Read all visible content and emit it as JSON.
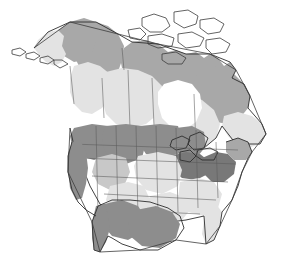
{
  "figure": {
    "kind": "map",
    "region": "North America",
    "projection_look": "conic",
    "background_color": "#ffffff",
    "width": 288,
    "height": 265,
    "has_labels": false,
    "has_legend": false,
    "has_title": false,
    "has_border": false
  },
  "palette": {
    "outline_stroke": "#3c3c3c",
    "subdivision_stroke": "#5a5a5a",
    "coast_stroke": "#2e2e2e",
    "shade_none": "#ffffff",
    "shade_light": "#e3e3e3",
    "shade_med": "#c8c8c8",
    "shade_medium": "#a8a8a8",
    "shade_dark": "#8d8d8d",
    "shade_darkest": "#787878",
    "water": "#ffffff"
  },
  "shading_levels": [
    {
      "key": "none",
      "color": "#ffffff",
      "rank": 0
    },
    {
      "key": "light",
      "color": "#e3e3e3",
      "rank": 1
    },
    {
      "key": "med",
      "color": "#c8c8c8",
      "rank": 2
    },
    {
      "key": "medium",
      "color": "#a8a8a8",
      "rank": 3
    },
    {
      "key": "dark",
      "color": "#8d8d8d",
      "rank": 4
    },
    {
      "key": "darkest",
      "color": "#787878",
      "rank": 5
    }
  ],
  "regions": [
    {
      "name": "alaska-mainland",
      "shade": "light"
    },
    {
      "name": "alaska-north-slope",
      "shade": "medium"
    },
    {
      "name": "aleutian-islands",
      "shade": "light"
    },
    {
      "name": "yukon-nwt-west",
      "shade": "medium"
    },
    {
      "name": "arctic-archipelago",
      "shade": "none"
    },
    {
      "name": "nunavut-mainland",
      "shade": "medium"
    },
    {
      "name": "hudson-bay",
      "shade": "none"
    },
    {
      "name": "northern-quebec-labrador",
      "shade": "medium"
    },
    {
      "name": "prairie-provinces",
      "shade": "light"
    },
    {
      "name": "british-columbia",
      "shade": "light"
    },
    {
      "name": "ontario-quebec-south",
      "shade": "light"
    },
    {
      "name": "maritimes",
      "shade": "light"
    },
    {
      "name": "us-pacific-northwest",
      "shade": "dark"
    },
    {
      "name": "us-mountain-west",
      "shade": "dark"
    },
    {
      "name": "us-great-basin",
      "shade": "med"
    },
    {
      "name": "us-southwest-desert",
      "shade": "light"
    },
    {
      "name": "us-northern-plains",
      "shade": "dark"
    },
    {
      "name": "us-central-plains",
      "shade": "light"
    },
    {
      "name": "us-upper-midwest",
      "shade": "dark"
    },
    {
      "name": "us-great-lakes-states",
      "shade": "darkest"
    },
    {
      "name": "us-appalachia-midatlantic",
      "shade": "darkest"
    },
    {
      "name": "us-new-england",
      "shade": "medium"
    },
    {
      "name": "us-southeast",
      "shade": "light"
    },
    {
      "name": "florida",
      "shade": "light"
    },
    {
      "name": "us-gulf-coast",
      "shade": "light"
    },
    {
      "name": "mexico-northwest",
      "shade": "dark"
    },
    {
      "name": "mexico-plateau",
      "shade": "dark"
    },
    {
      "name": "baja-california",
      "shade": "dark"
    },
    {
      "name": "great-lakes-water",
      "shade": "none"
    }
  ]
}
